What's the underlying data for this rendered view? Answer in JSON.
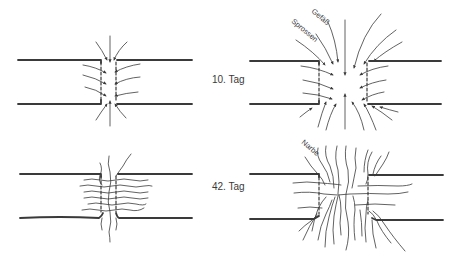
{
  "labels": {
    "day_10": "10. Tag",
    "day_42": "42. Tag",
    "vessel": "Gefäß",
    "sprouts": "Sprossen",
    "scar": "Narbe"
  },
  "panels": [
    {
      "id": "top-left",
      "stage": "10. Tag",
      "gap": "narrow",
      "content": "inward arrows"
    },
    {
      "id": "top-right",
      "stage": "10. Tag",
      "gap": "wide",
      "content": "inward arrows (Gefäß, Sprossen)"
    },
    {
      "id": "bottom-left",
      "stage": "42. Tag",
      "gap": "narrow",
      "content": "wavy bridging fibers"
    },
    {
      "id": "bottom-right",
      "stage": "42. Tag",
      "gap": "wide",
      "content": "scar fibers (Narbe)"
    }
  ],
  "colors": {
    "ink": "#3a3a3a",
    "background": "#ffffff"
  }
}
